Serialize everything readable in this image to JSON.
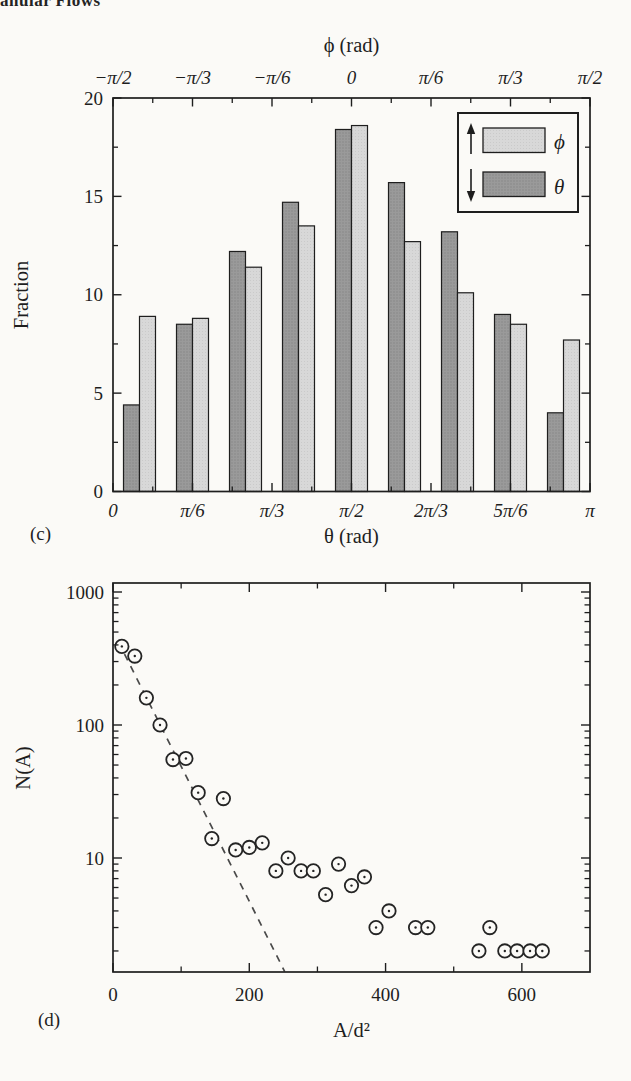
{
  "page": {
    "header_fragment": "anular Flows",
    "background": "#fbfaf7",
    "ink": "#1e1e1e"
  },
  "chart_data": [
    {
      "id": "c",
      "type": "bar",
      "panel_label": "(c)",
      "x_top": {
        "label": "ϕ (rad)",
        "tick_labels": [
          "−π/2",
          "−π/3",
          "−π/6",
          "0",
          "π/6",
          "π/3",
          "π/2"
        ],
        "tick_deg": [
          0,
          30,
          60,
          90,
          120,
          150,
          180
        ]
      },
      "x_bottom": {
        "label": "θ (rad)",
        "tick_labels": [
          "0",
          "π/6",
          "π/3",
          "π/2",
          "2π/3",
          "5π/6",
          "π"
        ],
        "tick_deg": [
          0,
          30,
          60,
          90,
          120,
          150,
          180
        ]
      },
      "y_left": {
        "label": "Fraction",
        "tick_labels": [
          "0",
          "5",
          "10",
          "15",
          "20"
        ],
        "tick_values": [
          0,
          5,
          10,
          15,
          20
        ],
        "minor_values": [
          2.5,
          7.5,
          12.5,
          17.5
        ],
        "range": [
          0,
          20
        ]
      },
      "bin_centers_deg": [
        10,
        30,
        50,
        70,
        90,
        110,
        130,
        150,
        170
      ],
      "series": [
        {
          "name": "θ",
          "direction": "down",
          "color": "#9a9a9a",
          "values": [
            4.4,
            8.5,
            12.2,
            14.7,
            18.4,
            15.7,
            13.2,
            9.0,
            4.0
          ]
        },
        {
          "name": "ϕ",
          "direction": "up",
          "color": "#d8d8d8",
          "values": [
            8.9,
            8.8,
            11.4,
            13.5,
            18.6,
            12.7,
            10.1,
            8.5,
            7.7
          ]
        }
      ],
      "legend": {
        "entries": [
          {
            "arrow": "up",
            "label": "ϕ",
            "color": "#d8d8d8"
          },
          {
            "arrow": "down",
            "label": "θ",
            "color": "#9a9a9a"
          }
        ]
      }
    },
    {
      "id": "d",
      "type": "scatter",
      "panel_label": "(d)",
      "xlabel": "A/d²",
      "ylabel": "N(A)",
      "x_axis": {
        "tick_labels": [
          "0",
          "200",
          "400",
          "600"
        ],
        "tick_values": [
          0,
          200,
          400,
          600
        ],
        "minor_values": [
          100,
          300,
          500
        ],
        "range": [
          0,
          700
        ]
      },
      "y_axis": {
        "scale": "log",
        "tick_labels": [
          "1000",
          "100",
          "10"
        ],
        "tick_values": [
          1000,
          100,
          10
        ],
        "range": [
          1.4,
          1180
        ]
      },
      "points": [
        [
          13,
          390
        ],
        [
          32,
          330
        ],
        [
          49,
          160
        ],
        [
          69,
          100
        ],
        [
          88,
          55
        ],
        [
          107,
          56
        ],
        [
          125,
          31
        ],
        [
          145,
          14
        ],
        [
          162,
          28
        ],
        [
          180,
          11.5
        ],
        [
          200,
          12
        ],
        [
          219,
          13
        ],
        [
          239,
          8
        ],
        [
          257,
          10
        ],
        [
          276,
          8
        ],
        [
          294,
          8
        ],
        [
          312,
          5.3
        ],
        [
          331,
          9
        ],
        [
          350,
          6.2
        ],
        [
          369,
          7.2
        ],
        [
          386,
          3
        ],
        [
          405,
          4
        ],
        [
          444,
          3
        ],
        [
          462,
          3
        ],
        [
          537,
          2
        ],
        [
          553,
          3
        ],
        [
          575,
          2
        ],
        [
          593,
          2
        ],
        [
          612,
          2
        ],
        [
          630,
          2
        ]
      ],
      "dashed_line": {
        "from": [
          8,
          420
        ],
        "to": [
          252,
          1.4
        ]
      }
    }
  ]
}
